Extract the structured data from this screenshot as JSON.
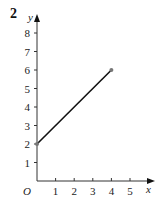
{
  "question_number": "2",
  "chart_data": {
    "type": "line",
    "title": "",
    "xlabel": "x",
    "ylabel": "y",
    "origin_label": "O",
    "x_ticks": [
      "1",
      "2",
      "3",
      "4",
      "5"
    ],
    "y_ticks": [
      "1",
      "2",
      "3",
      "4",
      "5",
      "6",
      "7",
      "8"
    ],
    "xlim": [
      0,
      5.5
    ],
    "ylim": [
      0,
      8.5
    ],
    "grid": false,
    "series": [
      {
        "name": "segment",
        "x": [
          0,
          4
        ],
        "y": [
          2,
          6
        ],
        "endpoints": "dots"
      }
    ]
  }
}
